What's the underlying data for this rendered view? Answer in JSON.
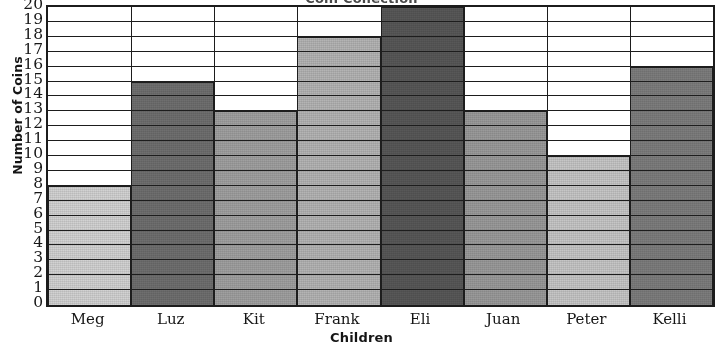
{
  "chart_data": {
    "type": "bar",
    "title": "Coin Collection",
    "xlabel": "Children",
    "ylabel": "Number of Coins",
    "categories": [
      "Meg",
      "Luz",
      "Kit",
      "Frank",
      "Eli",
      "Juan",
      "Peter",
      "Kelli"
    ],
    "values": [
      8,
      15,
      13,
      18,
      20,
      13,
      10,
      16
    ],
    "ylim": [
      0,
      20
    ],
    "ytick_step": 1,
    "ytick_labels": [
      "20",
      "19",
      "18",
      "17",
      "16",
      "15",
      "14",
      "13",
      "12",
      "11",
      "10",
      "9",
      "8",
      "7",
      "6",
      "5",
      "4",
      "3",
      "2",
      "1",
      "0"
    ],
    "grid": true,
    "grid_orientation": "horizontal",
    "legend": false,
    "bar_gap": 0,
    "bar_colors": [
      "#d2d2d2",
      "#6f6f6f",
      "#a0a0a0",
      "#b4b4b4",
      "#585858",
      "#9a9a9a",
      "#c6c6c6",
      "#7d7d7d"
    ],
    "axis_color": "#1d1d1d",
    "background": "#ffffff",
    "note": "Title is cropped at the top edge of the screenshot"
  }
}
